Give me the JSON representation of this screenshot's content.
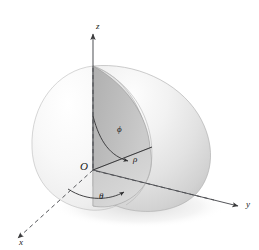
{
  "figure": {
    "background_color": "#ffffff"
  },
  "axes": {
    "x_label": "x",
    "y_label": "y",
    "z_label": "z",
    "axis_color": "#55565a",
    "dashed_color": "#6b6c70"
  },
  "origin": {
    "label": "O"
  },
  "angles": {
    "phi_label": "ϕ",
    "theta_label": "θ"
  },
  "radius": {
    "label": "ρ"
  },
  "surface": {
    "highlight_color": "#f4f4f4",
    "mid_color": "#dcdcdc",
    "shadow_color": "#c6c6c6",
    "cut_face_color": "#b9b9b9",
    "outline_color": "#9a9a9a"
  }
}
